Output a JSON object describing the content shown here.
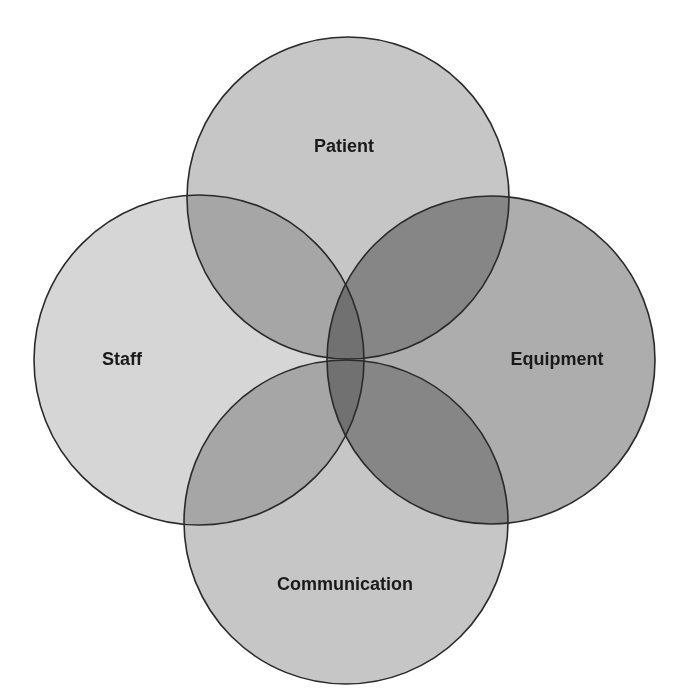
{
  "diagram": {
    "type": "venn",
    "sets": [
      {
        "id": "patient",
        "label": "Patient",
        "cx": 348,
        "cy": 198,
        "r": 161,
        "fill": "#c6c6c6",
        "label_x": 344,
        "label_y": 147
      },
      {
        "id": "staff",
        "label": "Staff",
        "cx": 199,
        "cy": 360,
        "r": 165,
        "fill": "#d6d6d6",
        "label_x": 122,
        "label_y": 360
      },
      {
        "id": "equipment",
        "label": "Equipment",
        "cx": 491,
        "cy": 360,
        "r": 164,
        "fill": "#adadad",
        "label_x": 557,
        "label_y": 360
      },
      {
        "id": "communication",
        "label": "Communication",
        "cx": 346,
        "cy": 522,
        "r": 162,
        "fill": "#c6c6c6",
        "label_x": 345,
        "label_y": 585
      }
    ],
    "outline_color": "#2a2a2a",
    "background": "#ffffff"
  }
}
